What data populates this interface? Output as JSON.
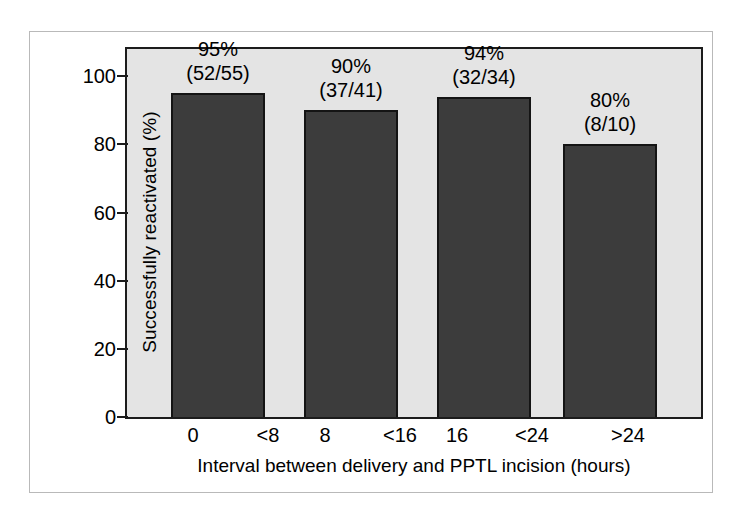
{
  "figure": {
    "background_color": "#ffffff",
    "frame_color": "#b9b9b9",
    "plot_background_color": "#e4e4e4",
    "axis_color": "#1c1c1c",
    "bar_color": "#3c3c3c",
    "bar_edge_color": "#141414"
  },
  "chart_data": {
    "type": "bar",
    "title": "",
    "xlabel": "Interval between delivery and PPTL incision (hours)",
    "ylabel": "Successfully reactivated (%)",
    "categories": [
      "0 <8",
      "8 <16",
      "16 <24",
      ">24"
    ],
    "category_parts": [
      {
        "left": "0",
        "right": "<8"
      },
      {
        "left": "8",
        "right": "<16"
      },
      {
        "left": "16",
        "right": "<24"
      },
      {
        "left": "",
        "right": ">24"
      }
    ],
    "values": [
      95,
      90,
      94,
      80
    ],
    "data_labels": [
      {
        "percent": "95%",
        "fraction": "(52/55)"
      },
      {
        "percent": "90%",
        "fraction": "(37/41)"
      },
      {
        "percent": "94%",
        "fraction": "(32/34)"
      },
      {
        "percent": "80%",
        "fraction": "(8/10)"
      }
    ],
    "numerators": [
      52,
      37,
      32,
      8
    ],
    "denominators": [
      55,
      41,
      34,
      10
    ],
    "ylim": [
      0,
      108
    ],
    "yticks": [
      0,
      20,
      40,
      60,
      80,
      100
    ],
    "ytick_labels": [
      "0",
      "20",
      "40",
      "60",
      "80",
      "100"
    ],
    "grid": false,
    "legend": "none"
  }
}
